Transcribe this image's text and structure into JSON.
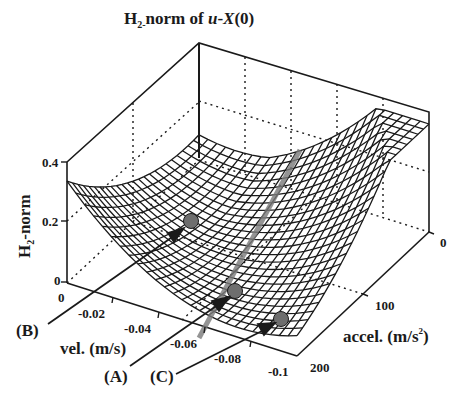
{
  "chart_data": {
    "type": "surface3d",
    "title": "H2-norm of u-X(0)",
    "title_parts": {
      "main": "H",
      "sub": "2-",
      "rest": "norm of ",
      "italic_u": "u",
      "dash": "-",
      "italic_X": "X",
      "tail": "(0)"
    },
    "zlabel": "H2-norm",
    "zlabel_parts": {
      "main": "H",
      "sub": "2",
      "rest": "-norm"
    },
    "xlabel": "vel. (m/s)",
    "ylabel": "accel. (m/s²)",
    "ylabel_parts": {
      "main": "accel. (m/s",
      "sup": "2",
      "tail": ")"
    },
    "z_ticks": [
      "0",
      "0.2",
      "0.4"
    ],
    "z_range": [
      0,
      0.4
    ],
    "x_ticks": [
      "0",
      "-0.02",
      "-0.04",
      "-0.06",
      "-0.08",
      "-0.1"
    ],
    "x_range": [
      -0.1,
      0
    ],
    "y_ticks": [
      "0",
      "100",
      "200"
    ],
    "y_range": [
      0,
      200
    ],
    "grid": true,
    "surface_description": "Valley-shaped H2-norm surface; minimum along a diagonal trough, rising to ~0.25 at vel=0/accel=0 corner and ~0.27 at vel=0/accel=200 and steeply at vel=-0.1/accel=0",
    "annotations": [
      {
        "label": "(B)",
        "marker": "circle",
        "approx_vel": -0.03,
        "approx_accel": 40,
        "approx_z": 0.12
      },
      {
        "label": "(A)",
        "marker": "circle",
        "approx_vel": -0.065,
        "approx_accel": 120,
        "approx_z": 0.05
      },
      {
        "label": "(C)",
        "marker": "circle",
        "approx_vel": -0.09,
        "approx_accel": 190,
        "approx_z": 0.06
      }
    ],
    "series": [
      {
        "name": "minimum trough line (gray)",
        "description": "diagonal gray line along the valley from vel=0/accel=0 region to vel=-0.07/accel=200"
      }
    ]
  },
  "labels": {
    "title_H": "H",
    "title_sub": "2-",
    "title_rest": "norm of ",
    "title_u": "u",
    "title_dash": "-",
    "title_X": "X",
    "title_tail": "(0)",
    "z_H": "H",
    "z_sub": "2",
    "z_rest": "-norm",
    "z_tick_0": "0",
    "z_tick_02": "0.2",
    "z_tick_04": "0.4",
    "x_tick_0": "0",
    "x_tick_002": "-0.02",
    "x_tick_004": "-0.04",
    "x_tick_006": "-0.06",
    "x_tick_008": "-0.08",
    "x_tick_01": "-0.1",
    "x_label": "vel. (m/s)",
    "y_tick_0": "0",
    "y_tick_100": "100",
    "y_tick_200": "200",
    "y_label_main": "accel. (m/s",
    "y_label_sup": "2",
    "y_label_tail": ")",
    "ann_A": "(A)",
    "ann_B": "(B)",
    "ann_C": "(C)"
  },
  "colors": {
    "ink": "#1a1a1a",
    "marker": "#6e6e6e",
    "trough": "#7a7a7a",
    "background": "#ffffff"
  }
}
